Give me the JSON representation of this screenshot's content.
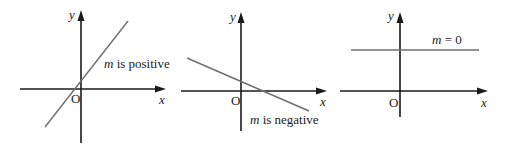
{
  "figure": {
    "panels": [
      {
        "id": "positive",
        "x_axis_label": "x",
        "y_axis_label": "y",
        "origin_label": "O",
        "annotation": {
          "var": "m",
          "text": " is positive"
        },
        "line_color": "#6e6e6e"
      },
      {
        "id": "negative",
        "x_axis_label": "x",
        "y_axis_label": "y",
        "origin_label": "O",
        "annotation": {
          "var": "m",
          "text": " is negative"
        },
        "line_color": "#6e6e6e"
      },
      {
        "id": "zero",
        "x_axis_label": "x",
        "y_axis_label": "y",
        "origin_label": "O",
        "annotation": {
          "var": "m",
          "text": " = 0"
        },
        "line_color": "#6e6e6e"
      }
    ],
    "axis_color": "#1a1a1a"
  }
}
